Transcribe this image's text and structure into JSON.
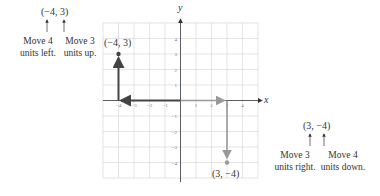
{
  "diagram": {
    "axes": {
      "x_label": "x",
      "y_label": "y",
      "range": {
        "x": [
          -5,
          5
        ],
        "y": [
          -5,
          5
        ]
      }
    },
    "x_ticks": [
      "-4",
      "-3",
      "-2",
      "-1",
      "1",
      "2",
      "3",
      "4"
    ],
    "y_ticks": [
      "4",
      "3",
      "2",
      "1",
      "-1",
      "-2",
      "-3",
      "-4"
    ],
    "points": [
      {
        "label": "(−4, 3)",
        "x": -4,
        "y": 3,
        "color": "#555555"
      },
      {
        "label": "(3, −4)",
        "x": 3,
        "y": -4,
        "color": "#999999"
      }
    ],
    "left_annotation": {
      "point": "(−4, 3)",
      "step1": "Move 4 units left.",
      "step1_line1": "Move 4",
      "step1_line2": "units left.",
      "step2_line1": "Move 3",
      "step2_line2": "units up."
    },
    "right_annotation": {
      "point": "(3, −4)",
      "step1_line1": "Move 3",
      "step1_line2": "units right.",
      "step2_line1": "Move 4",
      "step2_line2": "units down."
    }
  }
}
